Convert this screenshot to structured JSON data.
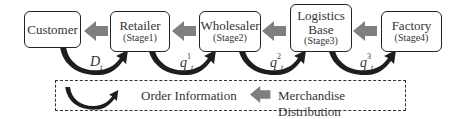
{
  "diagram": {
    "nodes": [
      {
        "id": "customer",
        "title": "Customer",
        "stage": ""
      },
      {
        "id": "retailer",
        "title": "Retailer",
        "stage": "(Stage1)"
      },
      {
        "id": "wholesaler",
        "title": "Wholesaler",
        "stage": "(Stage2)"
      },
      {
        "id": "logistics",
        "title": "Logistics Base",
        "stage": "(Stage3)"
      },
      {
        "id": "factory",
        "title": "Factory",
        "stage": "(Stage4)"
      }
    ],
    "flows": [
      {
        "label": "D",
        "sub": "t",
        "sup": ""
      },
      {
        "label": "q",
        "sub": "t",
        "sup": "1"
      },
      {
        "label": "q",
        "sub": "t",
        "sup": "2"
      },
      {
        "label": "q",
        "sub": "t",
        "sup": "3"
      }
    ],
    "legend": {
      "order_information": "Order Information",
      "merchandise_distribution": "Merchandise Distribution"
    },
    "colors": {
      "merchandise_arrow": "#7f7f7f",
      "order_arrow": "#1e1e1e",
      "border": "#222222"
    }
  }
}
